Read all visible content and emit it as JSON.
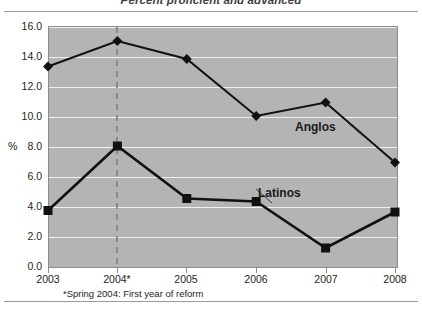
{
  "chart_data": {
    "type": "line",
    "title": "Percent proficient and advanced",
    "xlabel": "",
    "ylabel": "%",
    "categories": [
      "2003",
      "2004*",
      "2005",
      "2006",
      "2007",
      "2008"
    ],
    "x": [
      2003,
      2004,
      2005,
      2006,
      2007,
      2008
    ],
    "ylim": [
      0.0,
      16.0
    ],
    "ytick_labels": [
      "16.0",
      "14.0",
      "12.0",
      "10.0",
      "8.0",
      "6.0",
      "4.0",
      "2.0",
      "0.0"
    ],
    "ytick_values": [
      16.0,
      14.0,
      12.0,
      10.0,
      8.0,
      6.0,
      4.0,
      2.0,
      0.0
    ],
    "grid": true,
    "legend_position": "inline-annotation",
    "series": [
      {
        "name": "Anglos",
        "marker": "diamond",
        "values": [
          13.3,
          15.0,
          13.8,
          10.0,
          10.9,
          6.9
        ]
      },
      {
        "name": "Latinos",
        "marker": "square",
        "values": [
          3.7,
          8.0,
          4.5,
          4.3,
          1.2,
          3.6
        ]
      }
    ],
    "annotations": [
      {
        "name": "reform-marker",
        "type": "vline",
        "x": "2004*",
        "style": "dashed",
        "color": "#8a8a8a"
      }
    ],
    "footnote": "*Spring 2004: First year of reform",
    "plot_background": "#b4b4b4",
    "gridline_color": "#f0f0f0",
    "line_color": "#111111"
  }
}
